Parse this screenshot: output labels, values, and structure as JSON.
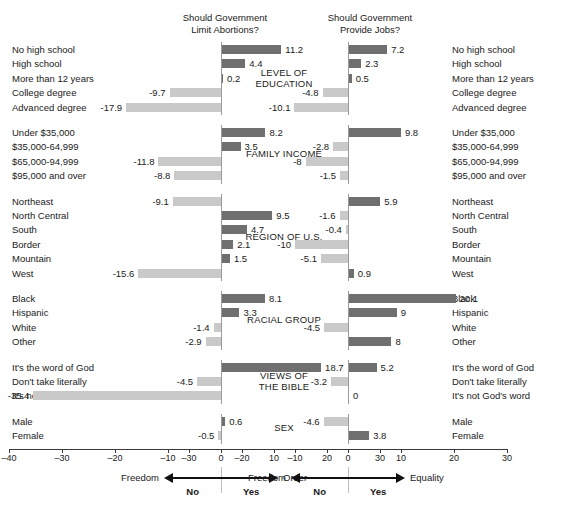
{
  "figure": {
    "left_panel_title": "Should Government\nLimit Abortions?",
    "right_panel_title": "Should Government\nProvide Jobs?",
    "bar_color_positive": "#6f6f6f",
    "bar_color_negative": "#c9c9c9"
  },
  "axes": {
    "left": {
      "ticks": [
        "-40",
        "-30",
        "-20",
        "-10",
        "0",
        "10",
        "20",
        "30"
      ],
      "tickvalues": [
        -40,
        -30,
        -20,
        -10,
        0,
        10,
        20,
        30
      ],
      "xlim": [
        -40,
        30
      ],
      "left_end_label": "Freedom",
      "right_end_label": "Order",
      "left_sub_label": "No",
      "right_sub_label": "Yes"
    },
    "right": {
      "ticks": [
        "-30",
        "-20",
        "-10",
        "0",
        "10",
        "20",
        "30"
      ],
      "tickvalues": [
        -30,
        -20,
        -10,
        0,
        10,
        20,
        30
      ],
      "xlim": [
        -30,
        30
      ],
      "left_end_label": "Freedom",
      "right_end_label": "Equality",
      "left_sub_label": "No",
      "right_sub_label": "Yes"
    }
  },
  "chart_data": {
    "type": "bar",
    "xlabel": "",
    "ylabel": "",
    "grid": false,
    "legend": "none",
    "series": [
      {
        "name": "Should Government Limit Abortions?",
        "xlim": [
          -40,
          30
        ]
      },
      {
        "name": "Should Government Provide Jobs?",
        "xlim": [
          -30,
          30
        ]
      }
    ],
    "groups": [
      {
        "name": "LEVEL OF\nEDUCATION",
        "name_plain": "LEVEL OF EDUCATION",
        "categories": [
          "No high school",
          "High school",
          "More than 12 years",
          "College degree",
          "Advanced degree"
        ],
        "abortions": [
          11.2,
          4.4,
          0.2,
          -9.7,
          -17.9
        ],
        "jobs": [
          7.2,
          2.3,
          0.5,
          -4.8,
          -10.1
        ],
        "abortions_labels": [
          "11.2",
          "4.4",
          "0.2",
          "-9.7",
          "-17.9"
        ],
        "jobs_labels": [
          "7.2",
          "2.3",
          "0.5",
          "-4.8",
          "-10.1"
        ]
      },
      {
        "name": "FAMILY INCOME",
        "name_plain": "FAMILY INCOME",
        "categories": [
          "Under $35,000",
          "$35,000-64,999",
          "$65,000-94,999",
          "$95,000 and over"
        ],
        "abortions": [
          8.2,
          3.5,
          -11.8,
          -8.8
        ],
        "jobs": [
          9.8,
          -2.8,
          -8,
          -1.5
        ],
        "abortions_labels": [
          "8.2",
          "3.5",
          "-11.8",
          "-8.8"
        ],
        "jobs_labels": [
          "9.8",
          "-2.8",
          "-8",
          "-1.5"
        ]
      },
      {
        "name": "REGION OF U.S.",
        "name_plain": "REGION OF U.S.",
        "categories": [
          "Northeast",
          "North Central",
          "South",
          "Border",
          "Mountain",
          "West"
        ],
        "abortions": [
          -9.1,
          9.5,
          4.7,
          2.1,
          1.5,
          -15.6
        ],
        "jobs": [
          5.9,
          -1.6,
          -0.4,
          -10,
          -5.1,
          0.9
        ],
        "abortions_labels": [
          "-9.1",
          "9.5",
          "4.7",
          "2.1",
          "1.5",
          "-15.6"
        ],
        "jobs_labels": [
          "5.9",
          "-1.6",
          "-0.4",
          "-10",
          "-5.1",
          "0.9"
        ]
      },
      {
        "name": "RACIAL GROUP",
        "name_plain": "RACIAL GROUP",
        "categories": [
          "Black",
          "Hispanic",
          "White",
          "Other"
        ],
        "abortions": [
          8.1,
          3.3,
          -1.4,
          -2.9
        ],
        "jobs": [
          20.1,
          9,
          -4.5,
          8
        ],
        "abortions_labels": [
          "8.1",
          "3.3",
          "-1.4",
          "-2.9"
        ],
        "jobs_labels": [
          "20.1",
          "9",
          "-4.5",
          "8"
        ]
      },
      {
        "name": "VIEWS OF\nTHE BIBLE",
        "name_plain": "VIEWS OF THE BIBLE",
        "categories": [
          "It's the word of God",
          "Don't take literally",
          "It's not God's word"
        ],
        "abortions": [
          18.7,
          -4.5,
          -35.4
        ],
        "jobs": [
          5.2,
          -3.2,
          0
        ],
        "abortions_labels": [
          "18.7",
          "-4.5",
          "-35.4"
        ],
        "jobs_labels": [
          "5.2",
          "-3.2",
          "0"
        ]
      },
      {
        "name": "SEX",
        "name_plain": "SEX",
        "categories": [
          "Male",
          "Female"
        ],
        "abortions": [
          0.6,
          -0.5
        ],
        "jobs": [
          -4.6,
          3.8
        ],
        "abortions_labels": [
          "0.6",
          "-0.5"
        ],
        "jobs_labels": [
          "-4.6",
          "3.8"
        ]
      }
    ]
  }
}
